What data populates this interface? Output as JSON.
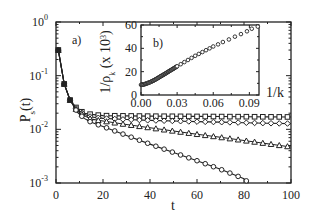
{
  "figure": {
    "panel_a_label": "a)",
    "panel_b_label": "b)"
  },
  "chart_data": [
    {
      "panel": "a)",
      "type": "line",
      "title": "",
      "xlabel": "t",
      "ylabel": "P_s(t)",
      "xscale": "linear",
      "yscale": "log",
      "xlim": [
        0,
        100
      ],
      "ylim": [
        0.001,
        1
      ],
      "xticks": [
        0,
        20,
        40,
        60,
        80,
        100
      ],
      "xtick_labels": [
        "0",
        "20",
        "40",
        "60",
        "80",
        "100"
      ],
      "yticks": [
        1,
        0.1,
        0.01,
        0.001
      ],
      "ytick_labels": [
        "10^0",
        "10^-1",
        "10^-2",
        "10^-3"
      ],
      "grid": false,
      "legend": null,
      "series": [
        {
          "name": "squares",
          "marker": "square",
          "x": [
            1,
            3.5,
            6,
            9,
            12,
            15,
            20,
            30,
            40,
            50,
            60,
            70,
            80,
            90,
            100
          ],
          "y": [
            0.3,
            0.07,
            0.035,
            0.024,
            0.02,
            0.019,
            0.018,
            0.0178,
            0.0176,
            0.0175,
            0.0174,
            0.0173,
            0.0172,
            0.0171,
            0.017
          ]
        },
        {
          "name": "diamonds",
          "marker": "diamond",
          "x": [
            1,
            3.5,
            6,
            9,
            12,
            15,
            20,
            30,
            40,
            50,
            60,
            70,
            80,
            90,
            100
          ],
          "y": [
            0.3,
            0.07,
            0.035,
            0.023,
            0.019,
            0.017,
            0.016,
            0.0152,
            0.0147,
            0.0143,
            0.0139,
            0.0136,
            0.0133,
            0.013,
            0.0128
          ]
        },
        {
          "name": "triangles",
          "marker": "triangle",
          "x": [
            1,
            3.5,
            6,
            9,
            12,
            15,
            20,
            30,
            40,
            50,
            60,
            70,
            80,
            90,
            100
          ],
          "y": [
            0.3,
            0.07,
            0.035,
            0.022,
            0.018,
            0.0155,
            0.0143,
            0.0123,
            0.0107,
            0.0093,
            0.0081,
            0.0071,
            0.0062,
            0.0054,
            0.0047
          ]
        },
        {
          "name": "circles",
          "marker": "circle",
          "x": [
            1,
            3.5,
            6,
            9,
            12,
            15,
            20,
            30,
            40,
            50,
            60,
            70,
            80,
            82
          ],
          "y": [
            0.3,
            0.07,
            0.035,
            0.021,
            0.016,
            0.0135,
            0.0113,
            0.0077,
            0.0053,
            0.0037,
            0.0026,
            0.0018,
            0.0012,
            0.001
          ]
        }
      ]
    },
    {
      "panel": "b)",
      "type": "scatter",
      "title": "",
      "xlabel": "1/k",
      "ylabel": "1/ρ_k (x 10^3)",
      "xlim": [
        0,
        0.098
      ],
      "ylim": [
        0,
        60
      ],
      "xticks": [
        0.0,
        0.03,
        0.06,
        0.09
      ],
      "xtick_labels": [
        "0.00",
        "0.03",
        "0.06",
        "0.09"
      ],
      "yticks": [
        0,
        20,
        40,
        60
      ],
      "ytick_labels": [
        "0",
        "20",
        "40",
        "60"
      ],
      "grid": false,
      "series": [
        {
          "name": "inset",
          "marker": "open-circle",
          "x": [
            0.0,
            0.002,
            0.004,
            0.006,
            0.008,
            0.01,
            0.012,
            0.014,
            0.016,
            0.018,
            0.02,
            0.022,
            0.024,
            0.026,
            0.028,
            0.03,
            0.033,
            0.036,
            0.039,
            0.042,
            0.045,
            0.048,
            0.051,
            0.054,
            0.057,
            0.06,
            0.064,
            0.068,
            0.073,
            0.078,
            0.083,
            0.088,
            0.092,
            0.097
          ],
          "y": [
            8.7,
            9.0,
            9.6,
            10.4,
            11.2,
            12.2,
            13.3,
            14.5,
            15.8,
            17.0,
            18.2,
            19.5,
            20.8,
            22.0,
            23.3,
            24.6,
            26.4,
            28.2,
            30.0,
            31.8,
            33.6,
            35.2,
            36.8,
            38.4,
            40.0,
            41.6,
            43.4,
            45.4,
            47.6,
            50.0,
            52.2,
            54.6,
            56.8,
            58.6
          ]
        }
      ]
    }
  ]
}
